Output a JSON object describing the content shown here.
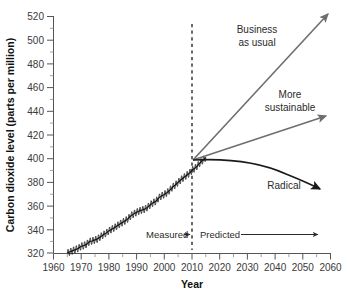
{
  "chart_data": {
    "type": "line",
    "title": "",
    "xlabel": "Year",
    "ylabel": "Carbon dioxide level (parts per million)",
    "xlim": [
      1960,
      2060
    ],
    "ylim": [
      320,
      520
    ],
    "xticks": [
      1960,
      1970,
      1980,
      1990,
      2000,
      2010,
      2020,
      2030,
      2040,
      2050,
      2060
    ],
    "yticks": [
      320,
      340,
      360,
      380,
      400,
      420,
      440,
      460,
      480,
      500,
      520
    ],
    "minor_tick_step_y": 10,
    "grid": false,
    "legend": "none",
    "divider_year": 2015,
    "divider_style": "dotted-vertical",
    "series": [
      {
        "name": "Measured",
        "style": "solid-black-with-seasonal-oscillation",
        "x": [
          1965,
          1966,
          1967,
          1968,
          1969,
          1970,
          1971,
          1972,
          1973,
          1974,
          1975,
          1976,
          1977,
          1978,
          1979,
          1980,
          1981,
          1982,
          1983,
          1984,
          1985,
          1986,
          1987,
          1988,
          1989,
          1990,
          1991,
          1992,
          1993,
          1994,
          1995,
          1996,
          1997,
          1998,
          1999,
          2000,
          2001,
          2002,
          2003,
          2004,
          2005,
          2006,
          2007,
          2008,
          2009,
          2010,
          2011,
          2012,
          2013,
          2014,
          2015
        ],
        "values": [
          320,
          321,
          322,
          323,
          324,
          325.7,
          326.3,
          327.5,
          329.7,
          330.2,
          331.1,
          332.0,
          333.8,
          335.4,
          336.8,
          338.7,
          340.1,
          341.4,
          343.0,
          344.6,
          346.0,
          347.4,
          349.2,
          351.6,
          353.1,
          354.4,
          355.6,
          356.4,
          357.1,
          358.8,
          360.8,
          362.6,
          363.8,
          366.6,
          368.3,
          369.5,
          371.0,
          373.2,
          375.8,
          377.5,
          379.8,
          381.9,
          383.8,
          385.6,
          387.4,
          389.9,
          391.6,
          393.8,
          396.5,
          398.6,
          400.8
        ]
      },
      {
        "name": "Business as usual",
        "style": "straight-arrow-gray",
        "x": [
          2015,
          2060
        ],
        "values": [
          400,
          520
        ]
      },
      {
        "name": "More sustainable",
        "style": "straight-arrow-gray",
        "x": [
          2015,
          2060
        ],
        "values": [
          400,
          437
        ]
      },
      {
        "name": "Radical",
        "style": "curved-arrow-black",
        "x": [
          2015,
          2060
        ],
        "values": [
          400,
          375
        ]
      }
    ],
    "annotations": [
      {
        "name": "business-as-usual",
        "text_line_1": "Business",
        "text_line_2": "as usual"
      },
      {
        "name": "more-sustainable",
        "text_line_1": "More",
        "text_line_2": "sustainable"
      },
      {
        "name": "radical",
        "text_line_1": "Radical",
        "text_line_2": ""
      },
      {
        "name": "measured-phase",
        "text_line_1": "Measured",
        "text_line_2": ""
      },
      {
        "name": "predicted-phase",
        "text_line_1": "Predicted",
        "text_line_2": ""
      }
    ]
  },
  "axes": {
    "y_title": "Carbon dioxide level (parts per million)",
    "x_title": "Year",
    "y_tick_labels": [
      "520",
      "500",
      "480",
      "460",
      "440",
      "420",
      "400",
      "380",
      "360",
      "340",
      "320"
    ],
    "x_tick_labels": [
      "1960",
      "1970",
      "1980",
      "1990",
      "2000",
      "2010",
      "2020",
      "2030",
      "2040",
      "2050",
      "2060"
    ]
  },
  "annotations": {
    "business_as_usual_l1": "Business",
    "business_as_usual_l2": "as usual",
    "more_sustainable_l1": "More",
    "more_sustainable_l2": "sustainable",
    "radical": "Radical",
    "measured": "Measured",
    "predicted": "Predicted"
  },
  "colors": {
    "axis": "#555555",
    "tick_text": "#3a3a3a",
    "title_text": "#111111",
    "measured_line": "#111111",
    "projection_gray": "#6e6e6e",
    "projection_black": "#1a1a1a",
    "background": "#ffffff"
  }
}
